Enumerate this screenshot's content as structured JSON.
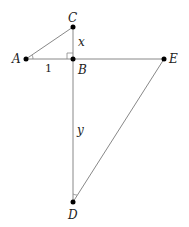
{
  "diagram": {
    "points": {
      "A": {
        "label": "A",
        "x": 26,
        "y": 59
      },
      "B": {
        "label": "B",
        "x": 73,
        "y": 59
      },
      "C": {
        "label": "C",
        "x": 73,
        "y": 27
      },
      "D": {
        "label": "D",
        "x": 73,
        "y": 202
      },
      "E": {
        "label": "E",
        "x": 164,
        "y": 59
      }
    },
    "segment_labels": {
      "AB": "1",
      "BC": "x",
      "BD": "y"
    },
    "angle_marks": [
      "angle-A",
      "angle-D"
    ],
    "right_angle_at": "B",
    "line_color": "#888888",
    "point_color": "#000000"
  }
}
